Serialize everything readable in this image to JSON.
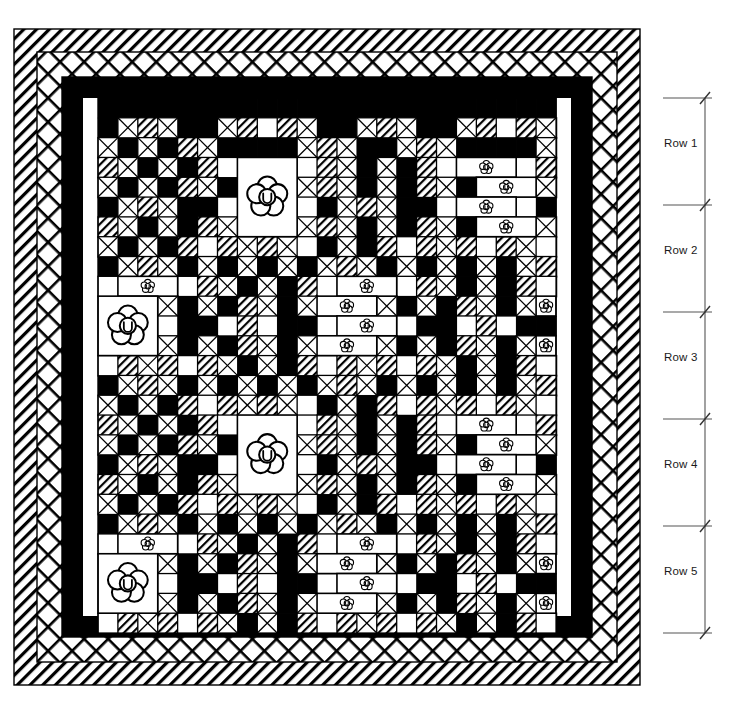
{
  "figure": {
    "type": "quilt-layout-diagram",
    "canvas": {
      "width": 751,
      "height": 716
    },
    "background_color": "#ffffff",
    "ink_color": "#000000"
  },
  "dimension_callout": {
    "name": "row-dimension-stack",
    "orientation": "vertical",
    "extension_line_x_start": 663,
    "extension_line_x_end": 712,
    "dimension_line_x": 705,
    "tick_style": "architectural-slash",
    "labels": [
      {
        "id": "row-1",
        "text": "Row 1",
        "y_top": 98,
        "y_bottom": 205,
        "label_x": 664,
        "label_y": 145
      },
      {
        "id": "row-2",
        "text": "Row 2",
        "y_top": 205,
        "y_bottom": 312,
        "label_x": 664,
        "label_y": 252
      },
      {
        "id": "row-3",
        "text": "Row 3",
        "y_top": 312,
        "y_bottom": 419,
        "label_x": 664,
        "label_y": 359
      },
      {
        "id": "row-4",
        "text": "Row 4",
        "y_top": 419,
        "y_bottom": 526,
        "label_x": 664,
        "label_y": 466
      },
      {
        "id": "row-5",
        "text": "Row 5",
        "y_top": 526,
        "y_bottom": 633,
        "label_x": 664,
        "label_y": 573
      }
    ]
  },
  "quilt": {
    "outer_frame": {
      "x": 14,
      "y": 29,
      "width": 626,
      "height": 656
    },
    "borders": [
      {
        "name": "outer-binding-border",
        "fill_pattern": "diagonal-hatch",
        "thickness": 23
      },
      {
        "name": "crosshatch-border",
        "fill_pattern": "cross-hatch",
        "thickness": 25
      },
      {
        "name": "inner-solid-border",
        "fill_pattern": "solid-black",
        "thickness": 21
      }
    ],
    "field": {
      "x": 98,
      "y": 98,
      "width": 458,
      "height": 535,
      "cell_size": 19.9
    },
    "grid": {
      "columns": 23,
      "rows": 27
    },
    "block_size_cells": 5,
    "patch_legend": [
      {
        "code": "X",
        "name": "cross-hatch-patch",
        "description": "white square with X diagonals"
      },
      {
        "code": "D",
        "name": "diagonal-stripe-patch",
        "description": "white square with diagonal stripes"
      },
      {
        "code": "W",
        "name": "plain-white-patch",
        "description": "solid white square"
      },
      {
        "code": "B",
        "name": "solid-black-patch",
        "description": "solid black square"
      },
      {
        "code": "F",
        "name": "flower-applique-patch",
        "description": "large white square with 5-petal appliqué flower"
      }
    ],
    "patch_map": [
      "BBBBBBBBBBBBBBBBBBBBBBB",
      "BXDXBBXDWDXBBXDXBBXDWDX",
      "XBXBDXBBBBXDXBBXDXBBBBX",
      "DXBXBDWFFFWDXBXBDWFFFWD",
      "XBXBDXBFFFXDXBXBDXBFFFX",
      "BXDXBBWFFFWBXDXBBWFFFWB",
      "DXBXBDXFFFXDXBXBDXBFFFX",
      "XBXBDWDXDXWBXBDWDXDWDXW",
      "BXDXBXBXBXBXDXBXBXBXBXD",
      "WFFFWDXBXBDWFFFWDXBXBDW",
      "FFFXBXBDXBXFFFXBXBDXBXF",
      "FFFWBBWDWBBWFFFWBBWDWBB",
      "FFFXBXBDXBXFFFXBXBDXBXF",
      "WDXDWDXBXBDWDXDWDXBXBDW",
      "BXDXBXBXBXBXDXBXBXBXBXD",
      "XBXBDWDXDXWBXBDWDXDWDXW",
      "DXBXBDWFFFWDXBXBDWFFFWD",
      "XBXBDXBFFFXDXBXBDXBFFFX",
      "BXDXBBWFFFWBXDXBBWFFFWB",
      "DXBXBDXFFFXDXBXBDXBFFFX",
      "XBXBDWDXDXWBXBDWDXDWDXW",
      "BXDXBXBXBXBXDXBXBXBXBXD",
      "WFFFWDXBXBDWFFFWDXBXBDW",
      "FFFXBXBDXBXFFFXBXBDXBXF",
      "FFFWBBWDWBBWFFFWBBWDWBB",
      "FFFXBXBDXBXFFFXBXBDXBXF",
      "WDXDWDXBXBDWDXDWDXBXBDW"
    ]
  }
}
